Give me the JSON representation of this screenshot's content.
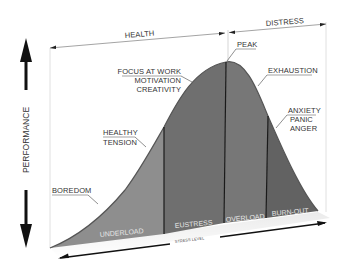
{
  "diagram": {
    "y_axis_label": "PERFORMANCE",
    "x_axis_label": "STRESS LEVEL",
    "top_zones": [
      {
        "label": "HEALTH"
      },
      {
        "label": "DISTRESS"
      }
    ],
    "annotations": [
      {
        "label": "BOREDOM"
      },
      {
        "label_lines": [
          "HEALTHY",
          "TENSION"
        ]
      },
      {
        "label_lines": [
          "FOCUS AT WORK",
          "MOTIVATION",
          "CREATIVITY"
        ]
      },
      {
        "label": "PEAK"
      },
      {
        "label": "EXHAUSTION"
      },
      {
        "label_lines": [
          "ANXIETY",
          "PANIC",
          "ANGER"
        ]
      }
    ],
    "regions": [
      {
        "label": "UNDERLOAD",
        "color": "#8e8e8e"
      },
      {
        "label": "EUSTRESS",
        "color": "#6f6f6f"
      },
      {
        "label": "OVERLOAD",
        "color": "#767676"
      },
      {
        "label": "BURN-OUT",
        "color": "#626262"
      }
    ],
    "colors": {
      "curve_edge": "#5a5a5a",
      "divider": "#1a1a1a",
      "arrow": "#111111",
      "dimension_line": "#666666"
    }
  }
}
